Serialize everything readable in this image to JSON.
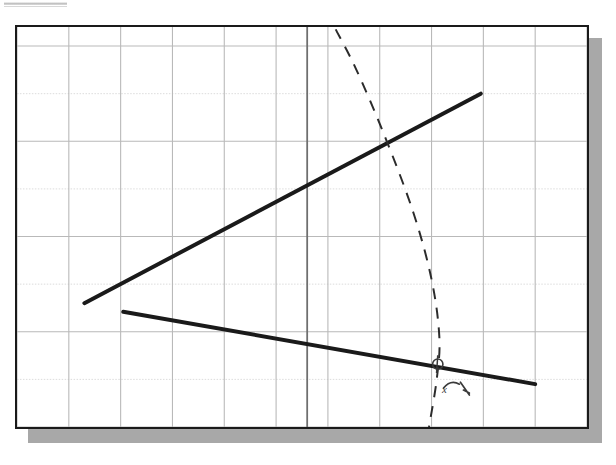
{
  "figure": {
    "caption": "",
    "background_color": "#ffffff",
    "panel_border_color": "#1a1a1a",
    "panel_shadow_color": "#a8a8a8",
    "grid_color": "#b9b9b9",
    "grid_faint_color": "#dcdcdc",
    "axis_color": "#6f6f6f",
    "data_line_color": "#1a1a1a",
    "dashed_curve_color": "#2b2b2b",
    "annotation_color": "#3a3a3a"
  },
  "artifact": {
    "name": "scan-edge-smudge",
    "description": "faint grey horizontal bar at top left of the scanned page"
  },
  "chart_data": {
    "type": "line",
    "title": "",
    "subtitle": "",
    "xlabel": "",
    "ylabel": "",
    "grid": true,
    "legend_position": "none",
    "xlim": [
      0,
      11
    ],
    "ylim": [
      0,
      8.4
    ],
    "x_tick_labels": [],
    "y_tick_labels": [],
    "x_gridlines": [
      0,
      1,
      2,
      3,
      4,
      5,
      6,
      7,
      8,
      9,
      10,
      11
    ],
    "y_gridlines": [
      0,
      1,
      2,
      3,
      4,
      5,
      6,
      7,
      8
    ],
    "emphasized_x_gridline": 5.6,
    "series": [
      {
        "name": "upper-branch",
        "style": "solid",
        "width": 4,
        "x": [
          1.3,
          8.95
        ],
        "values": [
          2.6,
          7.0
        ]
      },
      {
        "name": "lower-branch",
        "style": "solid",
        "width": 4,
        "x": [
          2.05,
          10.0
        ],
        "values": [
          2.42,
          0.9
        ]
      },
      {
        "name": "dashed-curve",
        "style": "dashed",
        "width": 2,
        "x": [
          6.15,
          6.55,
          7.1,
          7.65,
          8.0,
          8.15,
          8.1,
          7.95
        ],
        "values": [
          8.35,
          7.5,
          6.1,
          4.5,
          3.1,
          1.9,
          1.0,
          0.0
        ]
      }
    ],
    "annotations": [
      {
        "name": "intersection-circle",
        "kind": "circle-marker",
        "x": 8.12,
        "y": 1.32,
        "label": ""
      },
      {
        "name": "curved-arrow",
        "kind": "arrow",
        "x": 8.5,
        "y": 0.9,
        "label": ""
      },
      {
        "name": "x-mark-label",
        "kind": "text",
        "x": 8.25,
        "y": 0.72,
        "label": "x"
      }
    ]
  }
}
